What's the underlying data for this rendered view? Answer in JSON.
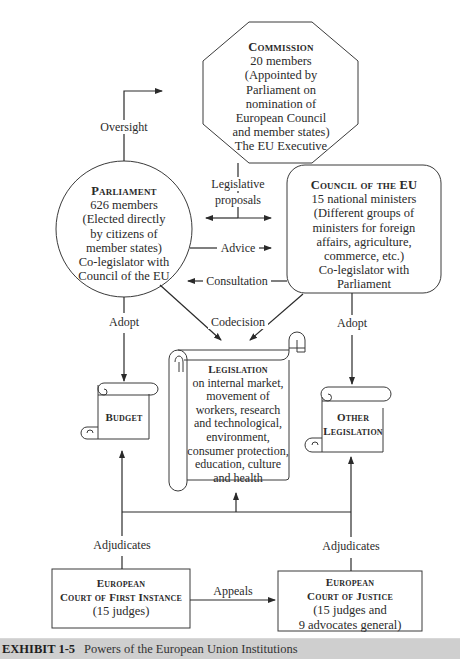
{
  "nodes": {
    "commission": {
      "title": "Commission",
      "lines": [
        "20 members",
        "(Appointed by",
        "Parliament on",
        "nomination of",
        "European Council",
        "and member states)",
        "The EU Executive"
      ]
    },
    "parliament": {
      "title": "Parliament",
      "lines": [
        "626 members",
        "(Elected directly",
        "by citizens of",
        "member states)",
        "Co-legislator with",
        "Council of the EU"
      ]
    },
    "council": {
      "title": "Council of the EU",
      "lines": [
        "15 national ministers",
        "(Different groups of",
        "ministers for foreign",
        "affairs, agriculture,",
        "commerce, etc.)",
        "Co-legislator with",
        "Parliament"
      ]
    },
    "budget": {
      "title": "Budget"
    },
    "legislation": {
      "title": "Legislation",
      "lines": [
        "on internal market,",
        "movement of",
        "workers, research",
        "and technological,",
        "environment,",
        "consumer protection,",
        "education, culture",
        "and health"
      ]
    },
    "other_legislation": {
      "title_line1": "Other",
      "title_line2": "Legislation"
    },
    "court_first_instance": {
      "title_line1": "European",
      "title_line2": "Court of First Instance",
      "lines": [
        "(15 judges)"
      ]
    },
    "court_justice": {
      "title_line1": "European",
      "title_line2": "Court of Justice",
      "lines": [
        "(15 judges and",
        "9 advocates general)"
      ]
    }
  },
  "edges": {
    "oversight": "Oversight",
    "legislative_proposals_1": "Legislative",
    "legislative_proposals_2": "proposals",
    "advice": "Advice",
    "consultation": "Consultation",
    "codecision": "Codecision",
    "adopt_left": "Adopt",
    "adopt_right": "Adopt",
    "adjudicates_left": "Adjudicates",
    "adjudicates_right": "Adjudicates",
    "appeals": "Appeals"
  },
  "caption": {
    "number": "EXHIBIT 1-5",
    "title": "Powers of the European Union Institutions"
  },
  "colors": {
    "line": "#2a2a2a",
    "caption_bar": "#cfcfcf"
  }
}
